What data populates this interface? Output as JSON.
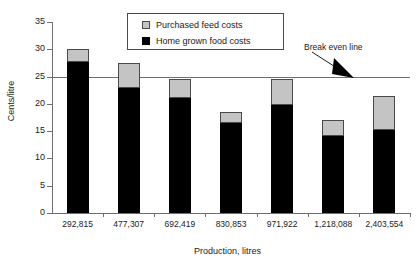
{
  "chart_data": {
    "type": "bar",
    "subtype": "stacked-vertical",
    "title": "",
    "xlabel": "Production, litres",
    "ylabel": "Cents/litre",
    "categories": [
      "292,815",
      "477,307",
      "692,419",
      "830,853",
      "971,922",
      "1,218,088",
      "2,403,554"
    ],
    "series": [
      {
        "name": "Home grown food costs",
        "color": "#000000",
        "values": [
          27.6,
          23.0,
          21.0,
          16.5,
          19.8,
          14.1,
          15.3
        ]
      },
      {
        "name": "Purchased feed costs",
        "color": "#c4c4c4",
        "values": [
          2.4,
          4.5,
          3.5,
          2.0,
          4.7,
          2.9,
          6.2
        ]
      }
    ],
    "totals": [
      30.0,
      27.5,
      24.5,
      18.5,
      24.5,
      17.0,
      21.5
    ],
    "ylim": [
      0,
      35
    ],
    "yticks": [
      0,
      5,
      10,
      15,
      20,
      25,
      30,
      35
    ],
    "ytick_labels": [
      "0",
      "5",
      "10",
      "15",
      "20",
      "25",
      "30",
      "35"
    ],
    "grid": false,
    "legend_position": "top-center",
    "annotations": [
      {
        "text": "Break even line",
        "type": "reference-line-label",
        "value": 25,
        "arrow": true
      }
    ],
    "reference_lines": [
      {
        "name": "Break even line",
        "value": 25,
        "color": "#6e6e6e"
      }
    ]
  },
  "legend": {
    "items": [
      {
        "label": "Purchased feed costs",
        "swatch": "purchased"
      },
      {
        "label": "Home grown food costs",
        "swatch": "homegrown"
      }
    ]
  },
  "annotation": {
    "break_even_label": "Break even line"
  }
}
